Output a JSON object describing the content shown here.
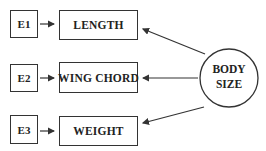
{
  "diagram": {
    "latent": {
      "label_line1": "BODY",
      "label_line2": "SIZE"
    },
    "indicators": [
      {
        "label": "LENGTH",
        "error": "E1"
      },
      {
        "label": "WING CHORD",
        "error": "E2"
      },
      {
        "label": "WEIGHT",
        "error": "E3"
      }
    ],
    "colors": {
      "stroke": "#333333",
      "text": "#222222",
      "background": "#ffffff"
    }
  }
}
